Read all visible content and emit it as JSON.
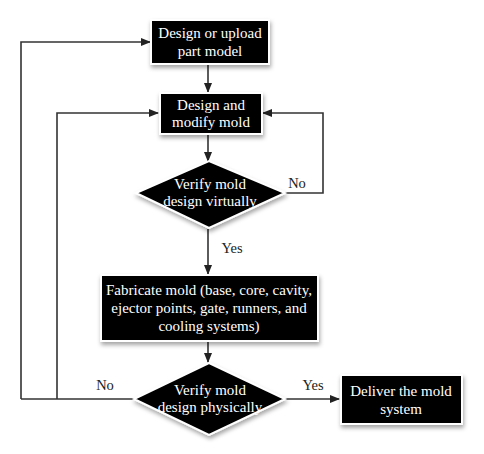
{
  "diagram": {
    "type": "flowchart",
    "nodes": [
      {
        "id": "n1",
        "kind": "process",
        "lines": [
          "Design or upload",
          "part model"
        ]
      },
      {
        "id": "n2",
        "kind": "process",
        "lines": [
          "Design and",
          "modify mold"
        ]
      },
      {
        "id": "n3",
        "kind": "decision",
        "lines": [
          "Verify mold",
          "design virtually"
        ]
      },
      {
        "id": "n4",
        "kind": "process",
        "lines": [
          "Fabricate mold (base, core, cavity,",
          "ejector points, gate, runners, and",
          "cooling systems)"
        ]
      },
      {
        "id": "n5",
        "kind": "decision",
        "lines": [
          "Verify mold",
          "design physically"
        ]
      },
      {
        "id": "n6",
        "kind": "process",
        "lines": [
          "Deliver the mold",
          "system"
        ]
      }
    ],
    "edges": [
      {
        "from": "n1",
        "to": "n2",
        "label": ""
      },
      {
        "from": "n2",
        "to": "n3",
        "label": ""
      },
      {
        "from": "n3",
        "to": "n2",
        "label": "No"
      },
      {
        "from": "n3",
        "to": "n4",
        "label": "Yes"
      },
      {
        "from": "n4",
        "to": "n5",
        "label": ""
      },
      {
        "from": "n5",
        "to": "n6",
        "label": "Yes"
      },
      {
        "from": "n5",
        "to": "n2",
        "label": "No"
      },
      {
        "from": "n5",
        "to": "n1",
        "label": "No"
      }
    ],
    "labels": {
      "virtual_no": "No",
      "virtual_yes": "Yes",
      "physical_no": "No",
      "physical_yes": "Yes"
    },
    "colors": {
      "node_fill": "#000000",
      "node_text": "#ffffff",
      "edge": "#333333",
      "background": "#ffffff"
    }
  }
}
